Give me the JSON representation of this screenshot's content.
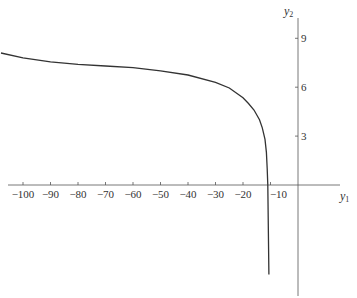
{
  "chart_data": {
    "type": "line",
    "title": "",
    "xlabel": "y1",
    "ylabel": "y2",
    "xlim": [
      -108,
      15
    ],
    "ylim": [
      -6.8,
      11.3
    ],
    "grid": false,
    "legend": null,
    "x_ticks": [
      -100,
      -90,
      -80,
      -70,
      -60,
      -50,
      -40,
      -30,
      -20,
      -10
    ],
    "x_tick_labels": [
      "−100",
      "−90",
      "−80",
      "−70",
      "−60",
      "−50",
      "−40",
      "−30",
      "−20",
      "−10"
    ],
    "y_ticks": [
      3,
      6,
      9
    ],
    "y_tick_labels": [
      "3",
      "6",
      "9"
    ],
    "series": [
      {
        "name": "curve",
        "color": "#333333",
        "x": [
          -108,
          -100,
          -90,
          -80,
          -70,
          -60,
          -50,
          -40,
          -30,
          -25,
          -20,
          -18,
          -16,
          -14,
          -13,
          -12,
          -11.5,
          -11.2,
          -11,
          -10.8,
          -10.6
        ],
        "y": [
          8.1,
          7.8,
          7.55,
          7.4,
          7.3,
          7.2,
          7.0,
          6.75,
          6.3,
          5.95,
          5.35,
          5.0,
          4.6,
          4.0,
          3.5,
          2.8,
          2.0,
          1.0,
          0.0,
          -2.5,
          -5.5
        ]
      }
    ]
  },
  "axes": {
    "x_title_main": "y",
    "x_title_sub": "1",
    "y_title_main": "y",
    "y_title_sub": "2"
  }
}
